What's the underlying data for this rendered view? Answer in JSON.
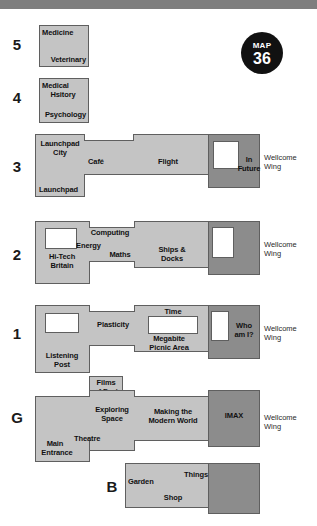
{
  "badge": {
    "word": "MAP",
    "number": "36"
  },
  "floors": [
    {
      "id": "5",
      "label": "5"
    },
    {
      "id": "4",
      "label": "4"
    },
    {
      "id": "3",
      "label": "3"
    },
    {
      "id": "2",
      "label": "2"
    },
    {
      "id": "1",
      "label": "1"
    },
    {
      "id": "G",
      "label": "G"
    },
    {
      "id": "B",
      "label": "B"
    }
  ],
  "level5": {
    "rooms": [
      "Medicine",
      "Veterinary"
    ]
  },
  "level4": {
    "rooms": [
      "Medical",
      "Hsitory",
      "Psychology"
    ]
  },
  "level3": {
    "rooms": [
      "Launchpad",
      "City",
      "Café",
      "Flight",
      "Launchpad",
      "In",
      "Future"
    ],
    "launchpad_city_line1": "Launchpad",
    "launchpad_city_line2": "City",
    "cafe": "Café",
    "flight": "Flight",
    "launchpad": "Launchpad",
    "in_future_line1": "In",
    "in_future_line2": "Future",
    "wing_line1": "Wellcome",
    "wing_line2": "Wing"
  },
  "level2": {
    "computing": "Computing",
    "energy": "Energy",
    "maths": "Maths",
    "ships_line1": "Ships &",
    "ships_line2": "Docks",
    "hitech_line1": "Hi-Tech",
    "hitech_line2": "Britain",
    "wing_line1": "Wellcome",
    "wing_line2": "Wing"
  },
  "level1": {
    "time": "Time",
    "plasticity": "Plasticity",
    "megabite_line1": "Megabite",
    "megabite_line2": "Picnic Area",
    "whoami_line1": "Who",
    "whoami_line2": "am I?",
    "listening_line1": "Listening",
    "listening_line2": "Post",
    "wing_line1": "Wellcome",
    "wing_line2": "Wing"
  },
  "levelG": {
    "films_line1": "Films",
    "films_line2": "of Fact",
    "exploring_line1": "Exploring",
    "exploring_line2": "Space",
    "making_line1": "Making the",
    "making_line2": "Modern World",
    "imax": "IMAX",
    "theatre": "Theatre",
    "entrance_line1": "Main",
    "entrance_line2": "Entrance",
    "wing_line1": "Wellcome",
    "wing_line2": "Wing"
  },
  "levelB": {
    "garden": "Garden",
    "things": "Things",
    "shop": "Shop"
  },
  "colors": {
    "light_block": "#c4c4c4",
    "dark_block": "#8c8c8c",
    "outline": "#5f5f5f",
    "badge": "#111111",
    "top_bar": "#7e7e7e"
  }
}
